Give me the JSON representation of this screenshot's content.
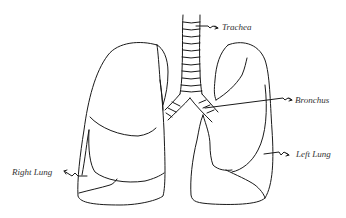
{
  "diagram": {
    "labels": {
      "trachea": "Trachea",
      "bronchus": "Bronchus",
      "right_lung": "Right Lung",
      "left_lung": "Left Lung"
    },
    "colors": {
      "line": "#1a1a1a",
      "text": "#333333",
      "background": "#ffffff"
    }
  }
}
